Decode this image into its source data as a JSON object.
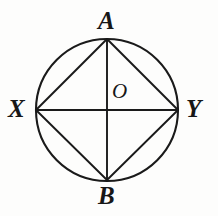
{
  "figure": {
    "kind": "geometry-diagram",
    "background_color": "#fdfdfc",
    "stroke_color": "#1a1a1a",
    "label_color": "#171717",
    "circle": {
      "center_x": 107,
      "center_y": 110,
      "radius": 71,
      "stroke_width": 2.1
    },
    "points": [
      {
        "id": "A",
        "label": "A",
        "role": "top-vertex",
        "x": 107,
        "y": 39,
        "label_x": 98,
        "label_y": 8
      },
      {
        "id": "X",
        "label": "X",
        "role": "left-vertex",
        "x": 36,
        "y": 110,
        "label_x": 8,
        "label_y": 96
      },
      {
        "id": "Y",
        "label": "Y",
        "role": "right-vertex",
        "x": 178,
        "y": 110,
        "label_x": 186,
        "label_y": 96
      },
      {
        "id": "B",
        "label": "B",
        "role": "bottom-vertex",
        "x": 107,
        "y": 180,
        "label_x": 98,
        "label_y": 183
      },
      {
        "id": "O",
        "label": "O",
        "role": "center",
        "x": 107,
        "y": 110,
        "label_x": 112,
        "label_y": 81
      }
    ],
    "diameters": [
      {
        "id": "XY",
        "from": "X",
        "to": "Y",
        "orientation": "horizontal",
        "x1": 36,
        "y1": 110,
        "x2": 178,
        "y2": 110
      },
      {
        "id": "AB",
        "from": "A",
        "to": "B",
        "orientation": "vertical",
        "x1": 107,
        "y1": 39,
        "x2": 107,
        "y2": 180
      }
    ],
    "chords": [
      {
        "id": "XA",
        "from": "X",
        "to": "A",
        "x1": 36,
        "y1": 110,
        "x2": 107,
        "y2": 39
      },
      {
        "id": "AY",
        "from": "A",
        "to": "Y",
        "x1": 107,
        "y1": 39,
        "x2": 178,
        "y2": 110
      },
      {
        "id": "YB",
        "from": "Y",
        "to": "B",
        "x1": 178,
        "y1": 110,
        "x2": 107,
        "y2": 180
      },
      {
        "id": "BX",
        "from": "B",
        "to": "X",
        "x1": 107,
        "y1": 180,
        "x2": 36,
        "y2": 110
      }
    ]
  }
}
